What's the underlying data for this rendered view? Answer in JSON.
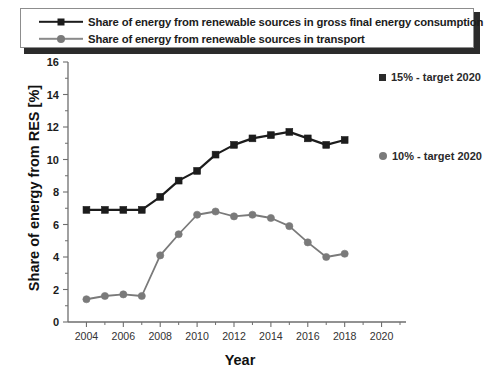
{
  "legend": {
    "items": [
      {
        "label": "Share of energy from renewable sources in gross final energy consumption",
        "marker": "square-marker",
        "color": "#1c1c1c"
      },
      {
        "label": "Share of energy from renewable sources in transport",
        "marker": "circle-marker",
        "color": "#7a7a7a"
      }
    ]
  },
  "annotations": [
    {
      "id": "target-15",
      "label": "15% - target 2020",
      "marker": "square-marker",
      "color": "#2a2a2a"
    },
    {
      "id": "target-10",
      "label": "10% - target 2020",
      "marker": "circle-marker",
      "color": "#7a7a7a"
    }
  ],
  "chart_data": {
    "type": "line",
    "title": "",
    "xlabel": "Year",
    "ylabel": "Share of energy from RES [%]",
    "xlim": [
      2003,
      2021
    ],
    "ylim": [
      0,
      16
    ],
    "ytick_step": 2,
    "yticks": [
      0,
      2,
      4,
      6,
      8,
      10,
      12,
      14,
      16
    ],
    "xticks": [
      2004,
      2006,
      2008,
      2010,
      2012,
      2014,
      2016,
      2018,
      2020
    ],
    "xticks_minor": [
      2005,
      2007,
      2009,
      2011,
      2013,
      2015,
      2017,
      2019,
      2021
    ],
    "grid": false,
    "legend_position": "top",
    "x": [
      2004,
      2005,
      2006,
      2007,
      2008,
      2009,
      2010,
      2011,
      2012,
      2013,
      2014,
      2015,
      2016,
      2017,
      2018
    ],
    "series": [
      {
        "name": "Share of energy from renewable sources in gross final energy consumption",
        "color": "#1c1c1c",
        "marker": "square-marker",
        "values": [
          6.9,
          6.9,
          6.9,
          6.9,
          7.7,
          8.7,
          9.3,
          10.3,
          10.9,
          11.3,
          11.5,
          11.7,
          11.3,
          10.9,
          11.2
        ]
      },
      {
        "name": "Share of energy from renewable sources in transport",
        "color": "#7a7a7a",
        "marker": "circle-marker",
        "values": [
          1.4,
          1.6,
          1.7,
          1.6,
          4.1,
          5.4,
          6.6,
          6.8,
          6.5,
          6.6,
          6.4,
          5.9,
          4.9,
          4.0,
          4.2
        ]
      }
    ],
    "annotations": [
      {
        "text": "15% - target 2020",
        "value": 15,
        "series": "gross final"
      },
      {
        "text": "10% - target 2020",
        "value": 10,
        "series": "transport"
      }
    ]
  }
}
